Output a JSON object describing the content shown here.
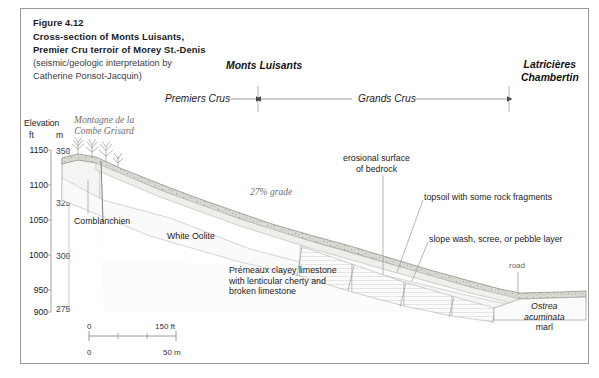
{
  "figure": {
    "number": "Figure 4.12",
    "title_line1": "Cross-section of Monts Luisants,",
    "title_line2": "Premier Cru terroir of Morey St.-Denis",
    "credit_line1": "(seismic/geologic interpretation by",
    "credit_line2": "Catherine Ponsot-Jacquin)"
  },
  "regions": {
    "monts_luisants": "Monts Luisants",
    "latricieres_line1": "Latricières",
    "latricieres_line2": "Chambertin",
    "premiers_crus": "Premiers Crus",
    "grands_crus": "Grands Crus"
  },
  "axis": {
    "title": "Elevation",
    "unit_ft": "ft",
    "unit_m": "m",
    "ft_ticks": [
      "1150",
      "1100",
      "1050",
      "1000",
      "950",
      "900"
    ],
    "m_ticks": [
      "350",
      "325",
      "300",
      "275"
    ]
  },
  "annotations": {
    "montagne_line1": "Montagne de la",
    "montagne_line2": "Combe Grisard",
    "comblanchien": "Comblanchien",
    "white_oolite": "White Oolite",
    "grade": "27% grade",
    "premeaux_line1": "Prémeaux clayey limestone",
    "premeaux_line2": "with lenticular cherty and",
    "premeaux_line3": "broken limestone",
    "erosional_line1": "erosional surface",
    "erosional_line2": "of bedrock",
    "topsoil": "topsoil with some rock fragments",
    "slope_wash": "slope wash, scree, or pebble layer",
    "road": "road",
    "ostrea_line1": "Ostrea",
    "ostrea_line2": "acuminata",
    "ostrea_line3": "marl"
  },
  "scale": {
    "ft_start": "0",
    "ft_end": "150 ft",
    "m_start": "0",
    "m_end": "50 m"
  },
  "colors": {
    "frame": "#9a9a9a",
    "line": "#8f8f8f",
    "text": "#1b1b1b",
    "muted": "#6e6e6e",
    "fill_light": "#f2f2f0",
    "fill_topsoil": "#dcdcd8"
  }
}
